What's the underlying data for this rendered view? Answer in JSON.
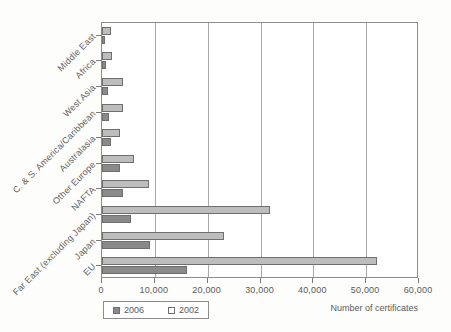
{
  "chart_data": {
    "type": "bar",
    "orientation": "horizontal",
    "title": "",
    "xlabel": "Number of certificates",
    "ylabel": "",
    "xlim": [
      0,
      60000
    ],
    "xticks": [
      0,
      10000,
      20000,
      30000,
      40000,
      50000,
      60000
    ],
    "xticklabels": [
      "0",
      "10,000",
      "20,000",
      "30,000",
      "40,000",
      "50,000",
      "60,000"
    ],
    "grid": true,
    "legend_position": "bottom-left",
    "categories": [
      "Middle East",
      "Africa",
      "West Asia",
      "C. & S. America/Caribbean",
      "Australasia",
      "Other Europe",
      "NAFTA",
      "Far East (excluding Japan)",
      "Japan",
      "EU"
    ],
    "series": [
      {
        "name": "2006",
        "color": "#8a8a8a",
        "values": [
          600,
          700,
          1200,
          1300,
          1700,
          3400,
          4000,
          5500,
          9000,
          16000
        ]
      },
      {
        "name": "2002",
        "color": "#bdbdbd",
        "values": [
          1700,
          1900,
          4000,
          4000,
          3500,
          6000,
          8900,
          31800,
          23000,
          52000
        ]
      }
    ]
  },
  "legend": {
    "items": [
      {
        "label": "2006",
        "swatch": "dark"
      },
      {
        "label": "2002",
        "swatch": "light"
      }
    ]
  },
  "axis": {
    "x_title": "Number of certificates"
  }
}
